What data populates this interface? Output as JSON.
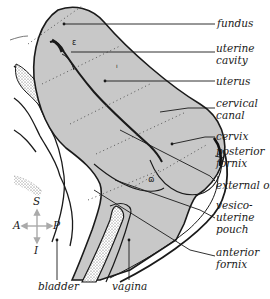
{
  "diagram": {
    "type": "anatomical-sagittal-section",
    "colors": {
      "tissue_fill": "#c8c8c8",
      "outline": "#1a1a1a",
      "stipple": "#555555",
      "background": "#ffffff"
    },
    "labels": {
      "fundus": "fundus",
      "uterine_cavity_1": "uterine",
      "uterine_cavity_2": "cavity",
      "uterus": "uterus",
      "cervical_canal_1": "cervical",
      "cervical_canal_2": "canal",
      "cervix": "cervix",
      "posterior_fornix_1": "posterior",
      "posterior_fornix_2": "fornix",
      "external_os": "external os",
      "vesico_1": "vesico-",
      "vesico_2": "uterine",
      "vesico_3": "pouch",
      "anterior_fornix_1": "anterior",
      "anterior_fornix_2": "fornix",
      "bladder": "bladder",
      "vagina": "vagina"
    },
    "orientation": {
      "superior": "S",
      "inferior": "I",
      "anterior": "A",
      "posterior": "P"
    }
  }
}
